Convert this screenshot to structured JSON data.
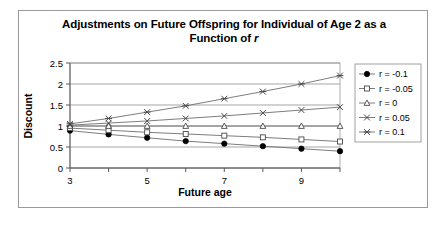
{
  "chart_data": {
    "type": "line",
    "title": "Adjustments on Future Offspring for Individual of Age 2 as a Function of r",
    "title_line1": "Adjustments on Future Offspring for Individual of Age 2 as a",
    "title_line2_prefix": "Function of ",
    "title_line2_italic": "r",
    "xlabel": "Future age",
    "ylabel": "Discount",
    "x": [
      3,
      4,
      5,
      6,
      7,
      8,
      9,
      10
    ],
    "xlim": [
      3,
      10
    ],
    "ylim": [
      0,
      2.5
    ],
    "xticks": [
      3,
      5,
      7,
      9
    ],
    "xtick_labels": [
      "3",
      "5",
      "7",
      "9"
    ],
    "yticks": [
      0,
      0.5,
      1,
      1.5,
      2,
      2.5
    ],
    "ytick_labels": [
      "0",
      "0.5",
      "1",
      "1.5",
      "2",
      "2.5"
    ],
    "grid": "horizontal",
    "legend_position": "right",
    "series": [
      {
        "name": "r = -0.1",
        "marker": "filled-circle",
        "values": [
          0.89,
          0.8,
          0.72,
          0.64,
          0.58,
          0.52,
          0.46,
          0.4
        ]
      },
      {
        "name": "r = -0.05",
        "marker": "open-square",
        "values": [
          0.95,
          0.9,
          0.85,
          0.81,
          0.77,
          0.73,
          0.68,
          0.63
        ]
      },
      {
        "name": "r = 0",
        "marker": "open-triangle",
        "values": [
          1.0,
          1.0,
          1.0,
          1.0,
          1.0,
          1.0,
          1.0,
          1.0
        ]
      },
      {
        "name": "r = 0.05",
        "marker": "cross-x",
        "values": [
          1.02,
          1.07,
          1.12,
          1.18,
          1.24,
          1.31,
          1.38,
          1.45
        ]
      },
      {
        "name": "r = 0.1",
        "marker": "asterisk",
        "values": [
          1.05,
          1.18,
          1.33,
          1.48,
          1.65,
          1.82,
          2.0,
          2.2
        ]
      }
    ]
  },
  "legend": {
    "entries": [
      {
        "label": "r = -0.1"
      },
      {
        "label": "r = -0.05"
      },
      {
        "label": "r = 0"
      },
      {
        "label": "r = 0.05"
      },
      {
        "label": "r = 0.1"
      }
    ]
  },
  "colors": {
    "line": "#6e6e6e",
    "grid": "#808080",
    "axis": "#5a5a5a",
    "border": "#9a9a9a",
    "text": "#000000",
    "background": "#ffffff"
  }
}
